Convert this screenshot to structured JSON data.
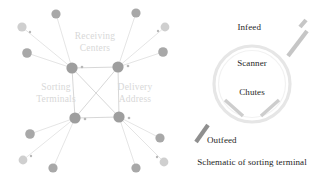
{
  "figure": {
    "background_color": "#ffffff",
    "width": 326,
    "height": 185
  },
  "network_diagram": {
    "name": "parcel-distribution-network",
    "labels": {
      "receiving_centers": "Receiving\nCenters",
      "receiving_centers_line1": "Receiving",
      "receiving_centers_line2": "Centers",
      "sorting_terminals_line1": "Sorting",
      "sorting_terminals_line2": "Terminals",
      "delivery_address_line1": "Delivery",
      "delivery_address_line2": "Address"
    },
    "label_color": "#d8d8d8",
    "node_colors": {
      "hub": "#9e9e9e",
      "leaf_dark": "#a8a8a8",
      "leaf_light": "#cfcfcf",
      "micro": "#b8b8b8"
    },
    "edge_color": "#dedede",
    "hubs": [
      {
        "id": "hub-tl",
        "x": 72,
        "y": 68,
        "r": 5.6
      },
      {
        "id": "hub-tr",
        "x": 118,
        "y": 67,
        "r": 5.6
      },
      {
        "id": "hub-bl",
        "x": 75,
        "y": 118,
        "r": 5.6
      },
      {
        "id": "hub-br",
        "x": 119,
        "y": 117,
        "r": 5.6
      }
    ],
    "core_edges": [
      [
        "hub-tl",
        "hub-tr"
      ],
      [
        "hub-tl",
        "hub-bl"
      ],
      [
        "hub-tr",
        "hub-br"
      ],
      [
        "hub-bl",
        "hub-br"
      ],
      [
        "hub-tl",
        "hub-br"
      ],
      [
        "hub-tr",
        "hub-bl"
      ]
    ],
    "leaves": [
      {
        "id": "l1",
        "x": 56,
        "y": 14,
        "r": 4.6,
        "tone": "leaf_dark",
        "hub": "hub-tl"
      },
      {
        "id": "l2",
        "x": 22,
        "y": 27,
        "r": 4.6,
        "tone": "leaf_light",
        "hub": "hub-tl"
      },
      {
        "id": "l3",
        "x": 27,
        "y": 53,
        "r": 4.8,
        "tone": "leaf_dark",
        "hub": "hub-tl"
      },
      {
        "id": "l4",
        "x": 136,
        "y": 13,
        "r": 4.6,
        "tone": "leaf_dark",
        "hub": "hub-tr"
      },
      {
        "id": "l5",
        "x": 165,
        "y": 27,
        "r": 4.4,
        "tone": "leaf_light",
        "hub": "hub-tr"
      },
      {
        "id": "l6",
        "x": 163,
        "y": 52,
        "r": 4.8,
        "tone": "leaf_dark",
        "hub": "hub-tr"
      },
      {
        "id": "l7",
        "x": 30,
        "y": 134,
        "r": 4.8,
        "tone": "leaf_dark",
        "hub": "hub-bl"
      },
      {
        "id": "l8",
        "x": 23,
        "y": 160,
        "r": 4.4,
        "tone": "leaf_light",
        "hub": "hub-bl"
      },
      {
        "id": "l9",
        "x": 53,
        "y": 168,
        "r": 4.6,
        "tone": "leaf_dark",
        "hub": "hub-bl"
      },
      {
        "id": "l10",
        "x": 160,
        "y": 138,
        "r": 4.6,
        "tone": "leaf_dark",
        "hub": "hub-br"
      },
      {
        "id": "l11",
        "x": 164,
        "y": 162,
        "r": 4.4,
        "tone": "leaf_light",
        "hub": "hub-br"
      },
      {
        "id": "l12",
        "x": 136,
        "y": 168,
        "r": 4.6,
        "tone": "leaf_dark",
        "hub": "hub-br"
      }
    ],
    "micro_nodes": [
      {
        "x": 30,
        "y": 32,
        "r": 1.2
      },
      {
        "x": 82,
        "y": 67,
        "r": 1.3
      },
      {
        "x": 128,
        "y": 66,
        "r": 1.3
      },
      {
        "x": 158,
        "y": 31,
        "r": 1.2
      },
      {
        "x": 85,
        "y": 119,
        "r": 1.3
      },
      {
        "x": 129,
        "y": 118,
        "r": 1.3
      },
      {
        "x": 31,
        "y": 156,
        "r": 1.2
      },
      {
        "x": 157,
        "y": 157,
        "r": 1.2
      }
    ]
  },
  "terminal_diagram": {
    "name": "sorting-terminal-schematic",
    "caption": "Schematic of sorting terminal",
    "labels": {
      "infeed": "Infeed",
      "scanner": "Scanner",
      "chutes": "Chutes",
      "outfeed": "Outfeed"
    },
    "label_color": "#262626",
    "ring": {
      "cx": 72,
      "cy": 84,
      "r": 38,
      "color": "#e6e6e6"
    },
    "infeed_bar_color": "#c6c6c6",
    "outfeed_bar_color": "#8f8f8f",
    "chute_color": "#cdcdcd"
  }
}
